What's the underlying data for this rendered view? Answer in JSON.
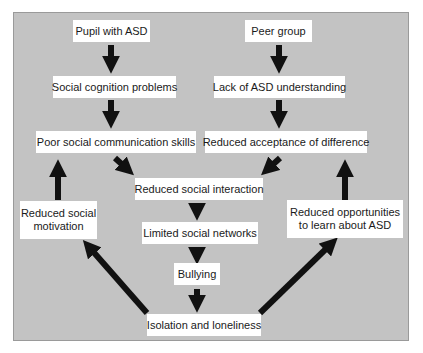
{
  "diagram": {
    "title": "",
    "background_color": "#c3c3c3",
    "box_color": "#ffffff",
    "arrow_color": "#111111",
    "nodes": [
      {
        "id": "pupil",
        "label": "Pupil with ASD"
      },
      {
        "id": "peer",
        "label": "Peer group"
      },
      {
        "id": "social_cognition",
        "label": "Social cognition problems"
      },
      {
        "id": "lack_understanding",
        "label": "Lack of ASD understanding"
      },
      {
        "id": "poor_comm",
        "label": "Poor social communication skills"
      },
      {
        "id": "reduced_acceptance",
        "label": "Reduced acceptance of difference"
      },
      {
        "id": "reduced_interaction",
        "label": "Reduced social interaction"
      },
      {
        "id": "reduced_motivation",
        "label": "Reduced social motivation",
        "lines": [
          "Reduced social",
          "motivation"
        ]
      },
      {
        "id": "reduced_opportunities",
        "label": "Reduced opportunities to learn about ASD",
        "lines": [
          "Reduced opportunities",
          "to learn about ASD"
        ]
      },
      {
        "id": "limited_networks",
        "label": "Limited social networks"
      },
      {
        "id": "bullying",
        "label": "Bullying"
      },
      {
        "id": "isolation",
        "label": "Isolation and loneliness"
      }
    ],
    "edges": [
      {
        "from": "pupil",
        "to": "social_cognition"
      },
      {
        "from": "social_cognition",
        "to": "poor_comm"
      },
      {
        "from": "peer",
        "to": "lack_understanding"
      },
      {
        "from": "lack_understanding",
        "to": "reduced_acceptance"
      },
      {
        "from": "poor_comm",
        "to": "reduced_interaction"
      },
      {
        "from": "reduced_acceptance",
        "to": "reduced_interaction"
      },
      {
        "from": "reduced_interaction",
        "to": "limited_networks"
      },
      {
        "from": "limited_networks",
        "to": "bullying"
      },
      {
        "from": "bullying",
        "to": "isolation"
      },
      {
        "from": "isolation",
        "to": "reduced_motivation"
      },
      {
        "from": "isolation",
        "to": "reduced_opportunities"
      },
      {
        "from": "reduced_motivation",
        "to": "poor_comm"
      },
      {
        "from": "reduced_opportunities",
        "to": "reduced_acceptance"
      }
    ]
  }
}
